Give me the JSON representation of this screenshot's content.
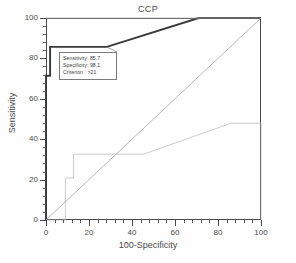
{
  "chart_data": {
    "type": "line",
    "title": "CCP",
    "xlabel": "100-Specificity",
    "ylabel": "Sensitivity",
    "xlim": [
      0,
      100
    ],
    "ylim": [
      0,
      100
    ],
    "grid": false,
    "legend_position": "none",
    "xticks": [
      0,
      20,
      40,
      60,
      80,
      100
    ],
    "yticks": [
      0,
      20,
      40,
      60,
      80,
      100
    ],
    "xtick_labels": [
      "0",
      "20",
      "40",
      "60",
      "80",
      "100"
    ],
    "ytick_labels": [
      "0",
      "20",
      "40",
      "60",
      "80",
      "100"
    ],
    "series": [
      {
        "name": "ROC curve",
        "style": "bold",
        "color": "#3a3a3a",
        "points": [
          [
            0,
            0
          ],
          [
            0,
            71.4
          ],
          [
            1.9,
            71.4
          ],
          [
            1.9,
            85.7
          ],
          [
            28.3,
            85.7
          ],
          [
            71.0,
            100
          ],
          [
            100,
            100
          ]
        ]
      },
      {
        "name": "95% CI upper bound",
        "style": "thin",
        "color": "#b4b4b4",
        "points": [
          [
            0,
            100
          ],
          [
            100,
            100
          ]
        ]
      },
      {
        "name": "95% CI lower bound",
        "style": "thin",
        "color": "#b4b4b4",
        "points": [
          [
            0,
            0
          ],
          [
            9.0,
            0
          ],
          [
            9.0,
            20.8
          ],
          [
            12.8,
            20.8
          ],
          [
            12.8,
            32.6
          ],
          [
            45.5,
            32.6
          ],
          [
            86.0,
            47.9
          ],
          [
            100,
            47.9
          ],
          [
            100,
            0
          ]
        ]
      },
      {
        "name": "reference diagonal",
        "style": "thin",
        "color": "#9a9a9a",
        "points": [
          [
            0,
            0
          ],
          [
            100,
            100
          ]
        ]
      }
    ],
    "annotations": [
      {
        "name": "operating-point-callout",
        "lines": [
          "Sensitivity: 85.7",
          "Specificity: 98.1",
          "Criterion : >21"
        ],
        "anchor_point": [
          28.3,
          85.7
        ]
      }
    ]
  },
  "colors": {
    "axis": "#4a4a4a",
    "curve": "#3a3a3a",
    "ci_band": "#b4b4b4",
    "diagonal": "#9a9a9a",
    "background": "#ffffff"
  }
}
